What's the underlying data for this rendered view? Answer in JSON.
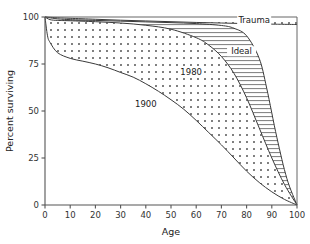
{
  "chart_data": {
    "type": "line",
    "title": "",
    "xlabel": "Age",
    "ylabel": "Percent surviving",
    "xlim": [
      0,
      100
    ],
    "ylim": [
      0,
      100
    ],
    "xticks": [
      0,
      10,
      20,
      30,
      40,
      50,
      60,
      70,
      80,
      90,
      100
    ],
    "yticks": [
      0,
      25,
      50,
      75,
      100
    ],
    "xtick_labels": [
      "0",
      "10",
      "20",
      "30",
      "40",
      "50",
      "60",
      "70",
      "80",
      "90",
      "100"
    ],
    "ytick_labels": [
      "0",
      "25",
      "50",
      "75",
      "100"
    ],
    "grid": false,
    "legend": "inline-annotations",
    "annotations": [
      {
        "label": "Trauma",
        "x": 83,
        "y": 97.5
      },
      {
        "label": "Ideal",
        "x": 78,
        "y": 81
      },
      {
        "label": "1980",
        "x": 58,
        "y": 70
      },
      {
        "label": "1900",
        "x": 40,
        "y": 53
      }
    ],
    "fills": [
      {
        "name": "trauma-band",
        "pattern": "dots",
        "between": [
          "trauma",
          "ideal"
        ]
      },
      {
        "name": "ideal-band",
        "pattern": "horizontal-hatch",
        "between": [
          "ideal",
          "1980"
        ]
      },
      {
        "name": "survival-gap-band",
        "pattern": "dots",
        "between": [
          "1980",
          "1900"
        ]
      }
    ],
    "series": [
      {
        "name": "Trauma",
        "pattern": "solid",
        "x": [
          0,
          5,
          10,
          20,
          30,
          40,
          50,
          60,
          70,
          80,
          90,
          95,
          100
        ],
        "values": [
          100,
          99.6,
          99.3,
          98.8,
          98.3,
          97.9,
          97.5,
          97.1,
          96.8,
          96.5,
          96.2,
          96.1,
          96.0
        ]
      },
      {
        "name": "Ideal",
        "pattern": "solid",
        "x": [
          0,
          5,
          10,
          20,
          30,
          40,
          50,
          60,
          70,
          75,
          80,
          85,
          88,
          92,
          96,
          100
        ],
        "values": [
          100,
          99,
          98.6,
          98.2,
          97.8,
          97.4,
          97,
          96.5,
          95.5,
          94,
          90,
          78,
          62,
          36,
          14,
          0
        ]
      },
      {
        "name": "1980",
        "pattern": "solid",
        "x": [
          0,
          2,
          5,
          10,
          20,
          30,
          40,
          50,
          60,
          65,
          70,
          75,
          80,
          85,
          90,
          95,
          100
        ],
        "values": [
          100,
          98.6,
          98.2,
          98,
          97.5,
          96.8,
          95.6,
          93.5,
          89,
          85,
          79,
          70,
          57,
          41,
          25,
          11,
          0
        ]
      },
      {
        "name": "1900",
        "pattern": "solid",
        "x": [
          0,
          1,
          2,
          5,
          10,
          15,
          20,
          25,
          30,
          35,
          40,
          45,
          50,
          55,
          60,
          65,
          70,
          75,
          80,
          85,
          90,
          95,
          100
        ],
        "values": [
          100,
          90,
          86.5,
          81,
          78,
          76.5,
          75,
          73,
          70.5,
          68,
          64.5,
          60.5,
          56,
          51,
          45,
          38.5,
          32,
          25,
          18,
          12,
          7,
          3,
          0
        ]
      }
    ]
  }
}
